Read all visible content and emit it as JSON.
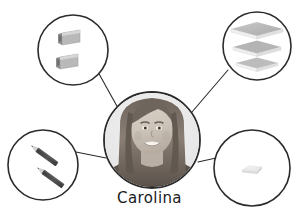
{
  "diagram": {
    "type": "concept-map",
    "background_color": "#ffffff",
    "line_color": "#2b2b2b",
    "circle_stroke_color": "#2b2b2b",
    "center": {
      "label": "Carolina",
      "icon": "portrait-photo",
      "description": "grayscale photograph of a smiling girl with long hair",
      "cx": 152,
      "cy": 140,
      "r": 48
    },
    "nodes": [
      {
        "id": "node-top-left",
        "icon": "pencil-sharpener-icon",
        "label": "",
        "item_count": 2,
        "color": "#b6b6b6",
        "cx": 73,
        "cy": 50,
        "r": 35
      },
      {
        "id": "node-top-right",
        "icon": "stacked-notebooks-icon",
        "label": "",
        "item_count": 3,
        "color": "#bdbdbd",
        "cx": 257,
        "cy": 46,
        "r": 34
      },
      {
        "id": "node-bottom-left",
        "icon": "pencil-icon",
        "label": "",
        "item_count": 2,
        "color": "#4a4a4a",
        "cx": 43,
        "cy": 165,
        "r": 35
      },
      {
        "id": "node-bottom-right",
        "icon": "eraser-icon",
        "label": "",
        "item_count": 1,
        "color": "#e3e3e3",
        "cx": 252,
        "cy": 168,
        "r": 38
      }
    ],
    "connectors": [
      {
        "id": "connector-top-left",
        "from": "node-top-left",
        "to": "center"
      },
      {
        "id": "connector-top-right",
        "from": "node-top-right",
        "to": "center"
      },
      {
        "id": "connector-bottom-left",
        "from": "node-bottom-left",
        "to": "center"
      },
      {
        "id": "connector-bottom-right",
        "from": "node-bottom-right",
        "to": "center"
      }
    ]
  }
}
